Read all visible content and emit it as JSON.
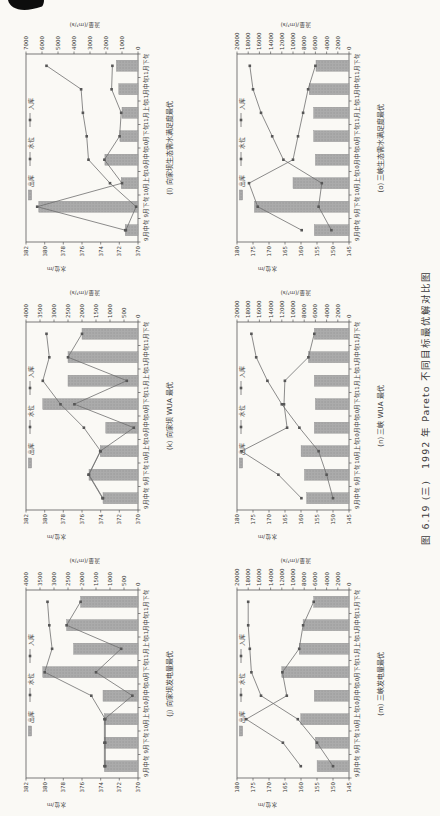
{
  "page": {
    "caption": "图 6.19 (三)　1992 年 Pareto 不同目标最优解对比图",
    "background": "#faf9f5",
    "corner_mark": "black scan artifact top-left"
  },
  "colors": {
    "bar_fill": "#ababab",
    "bar_dot": "#8a8a8a",
    "bar_stroke": "#8f8f8f",
    "line": "#6e6e6e",
    "marker": "#565656",
    "axis": "#5a5a5a",
    "text": "#3a3a3a"
  },
  "legend": {
    "items": [
      {
        "label": "出库",
        "symbol": "bar"
      },
      {
        "label": "水位",
        "symbol": "line-marker"
      },
      {
        "label": "入库",
        "symbol": "line-marker"
      }
    ]
  },
  "axes": {
    "categories": [
      "9月中旬",
      "9月下旬",
      "10月上旬",
      "10月中旬",
      "10月下旬",
      "11月上旬",
      "11月中旬",
      "11月下旬"
    ],
    "flow_axis_title": "流量/(m³/s)",
    "level_axis_title": "水位/m"
  },
  "chart_data": [
    {
      "type": "bar",
      "id": "j",
      "title": "(j) 向家坝发电量最优",
      "categories": [
        "9月中旬",
        "9月下旬",
        "10月上旬",
        "10月中旬",
        "10月下旬",
        "11月上旬",
        "11月中旬",
        "11月下旬"
      ],
      "flow_axis": {
        "min": 0,
        "max": 4000,
        "ticks": [
          0,
          500,
          1000,
          1500,
          2000,
          2500,
          3000,
          3500,
          4000
        ]
      },
      "level_axis": {
        "min": 370,
        "max": 382,
        "ticks": [
          370,
          372,
          374,
          376,
          378,
          380,
          382
        ]
      },
      "series": [
        {
          "name": "出库",
          "kind": "bar",
          "axis": "flow",
          "values": [
            1200,
            1200,
            1200,
            1250,
            3400,
            2300,
            2550,
            2050
          ]
        },
        {
          "name": "水位",
          "kind": "line",
          "axis": "level",
          "values": [
            373.5,
            373.5,
            373.5,
            375,
            380,
            379.2,
            379.5,
            379.7
          ]
        },
        {
          "name": "入库",
          "kind": "line",
          "axis": "flow",
          "values": [
            1200,
            1200,
            1200,
            200,
            1500,
            600,
            2550,
            2050
          ]
        }
      ]
    },
    {
      "type": "bar",
      "id": "k",
      "title": "(k) 向家坝 WUA 最优",
      "categories": [
        "9月中旬",
        "9月下旬",
        "10月上旬",
        "10月中旬",
        "10月下旬",
        "11月上旬",
        "11月中旬",
        "11月下旬"
      ],
      "flow_axis": {
        "min": 0,
        "max": 4000,
        "ticks": [
          0,
          500,
          1000,
          1500,
          2000,
          2500,
          3000,
          3500,
          4000
        ]
      },
      "level_axis": {
        "min": 370,
        "max": 382,
        "ticks": [
          370,
          372,
          374,
          376,
          378,
          380,
          382
        ]
      },
      "series": [
        {
          "name": "出库",
          "kind": "bar",
          "axis": "flow",
          "values": [
            1250,
            1750,
            1350,
            1150,
            3400,
            2500,
            2500,
            2000
          ]
        },
        {
          "name": "水位",
          "kind": "line",
          "axis": "level",
          "values": [
            373.8,
            375.3,
            374,
            375.8,
            378.3,
            380.2,
            379.5,
            379.8
          ]
        },
        {
          "name": "入库",
          "kind": "line",
          "axis": "flow",
          "values": [
            1250,
            1750,
            1350,
            150,
            2270,
            400,
            2500,
            2000
          ]
        }
      ]
    },
    {
      "type": "bar",
      "id": "l",
      "title": "(l) 向家坝生态需水满足度最优",
      "categories": [
        "9月中旬",
        "9月下旬",
        "10月上旬",
        "10月中旬",
        "10月下旬",
        "11月上旬",
        "11月中旬",
        "11月下旬"
      ],
      "flow_axis": {
        "min": 0,
        "max": 7000,
        "ticks": [
          0,
          1000,
          2000,
          3000,
          4000,
          5000,
          6000,
          7000
        ]
      },
      "level_axis": {
        "min": 370,
        "max": 382,
        "ticks": [
          370,
          372,
          374,
          376,
          378,
          380,
          382
        ]
      },
      "series": [
        {
          "name": "出库",
          "kind": "bar",
          "axis": "flow",
          "values": [
            800,
            6200,
            1050,
            2070,
            1130,
            1000,
            1200,
            1350
          ]
        },
        {
          "name": "水位",
          "kind": "line",
          "axis": "level",
          "values": [
            371.3,
            370.2,
            373,
            375.3,
            375.5,
            375.9,
            376.1,
            379.8
          ]
        },
        {
          "name": "入库",
          "kind": "line",
          "axis": "flow",
          "values": [
            800,
            6300,
            1000,
            2100,
            1150,
            1050,
            1650,
            1600
          ]
        }
      ]
    },
    {
      "type": "bar",
      "id": "m",
      "title": "(m) 三峡发电量最优",
      "categories": [
        "9月中旬",
        "9月下旬",
        "10月上旬",
        "10月中旬",
        "10月下旬",
        "11月上旬",
        "11月中旬",
        "11月下旬"
      ],
      "flow_axis": {
        "min": 0,
        "max": 20000,
        "ticks": [
          0,
          2000,
          4000,
          6000,
          8000,
          10000,
          12000,
          14000,
          16000,
          18000,
          20000
        ]
      },
      "level_axis": {
        "min": 145,
        "max": 180,
        "ticks": [
          145,
          150,
          155,
          160,
          165,
          170,
          175,
          180
        ]
      },
      "series": [
        {
          "name": "出库",
          "kind": "bar",
          "axis": "flow",
          "values": [
            5700,
            6000,
            8600,
            6200,
            12000,
            8900,
            8200,
            6300
          ]
        },
        {
          "name": "水位",
          "kind": "line",
          "axis": "level",
          "values": [
            150,
            155,
            161,
            172.5,
            175.5,
            176,
            176.5,
            176.5
          ]
        },
        {
          "name": "入库",
          "kind": "line",
          "axis": "flow",
          "values": [
            8600,
            11800,
            18350,
            11100,
            11900,
            8900,
            8200,
            6300
          ]
        }
      ]
    },
    {
      "type": "bar",
      "id": "n",
      "title": "(n) 三峡 WUA 最优",
      "categories": [
        "9月中旬",
        "9月下旬",
        "10月上旬",
        "10月中旬",
        "10月下旬",
        "11月上旬",
        "11月中旬",
        "11月下旬"
      ],
      "flow_axis": {
        "min": 0,
        "max": 20000,
        "ticks": [
          0,
          2000,
          4000,
          6000,
          8000,
          10000,
          12000,
          14000,
          16000,
          18000,
          20000
        ]
      },
      "level_axis": {
        "min": 145,
        "max": 180,
        "ticks": [
          145,
          150,
          155,
          160,
          165,
          170,
          175,
          180
        ]
      },
      "series": [
        {
          "name": "出库",
          "kind": "bar",
          "axis": "flow",
          "values": [
            7550,
            7950,
            8550,
            6200,
            6000,
            6200,
            7250,
            6200
          ]
        },
        {
          "name": "水位",
          "kind": "line",
          "axis": "level",
          "values": [
            150,
            152,
            154.5,
            160.5,
            166,
            170.5,
            174,
            175.5
          ]
        },
        {
          "name": "入库",
          "kind": "line",
          "axis": "flow",
          "values": [
            8500,
            12600,
            19200,
            11050,
            11600,
            11450,
            7250,
            6200
          ]
        }
      ]
    },
    {
      "type": "bar",
      "id": "o",
      "title": "(o) 三峡生态需水满足度最优",
      "categories": [
        "9月中旬",
        "9月下旬",
        "10月上旬",
        "10月中旬",
        "10月下旬",
        "11月上旬",
        "11月中旬",
        "11月下旬"
      ],
      "flow_axis": {
        "min": 0,
        "max": 20000,
        "ticks": [
          0,
          2000,
          4000,
          6000,
          8000,
          10000,
          12000,
          14000,
          16000,
          18000,
          20000
        ]
      },
      "level_axis": {
        "min": 145,
        "max": 180,
        "ticks": [
          145,
          150,
          155,
          160,
          165,
          170,
          175,
          180
        ]
      },
      "series": [
        {
          "name": "出库",
          "kind": "bar",
          "axis": "flow",
          "values": [
            6200,
            16900,
            10000,
            6000,
            6300,
            6300,
            7100,
            5900
          ]
        },
        {
          "name": "水位",
          "kind": "line",
          "axis": "level",
          "values": [
            150.5,
            154.5,
            153.5,
            165.5,
            169,
            172.5,
            175,
            176
          ]
        },
        {
          "name": "入库",
          "kind": "line",
          "axis": "flow",
          "values": [
            8450,
            16300,
            17850,
            10000,
            9100,
            8200,
            7300,
            6000
          ]
        }
      ]
    }
  ]
}
